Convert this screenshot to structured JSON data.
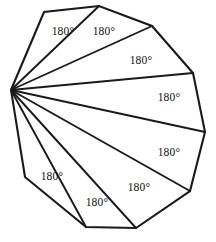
{
  "figure": {
    "name": "decagon-triangulation",
    "shape_label": "decagon",
    "stroke_color": "#1a1a1a",
    "fill_color": "#ffffff",
    "background_color": "#ffffff",
    "width": 216,
    "height": 242,
    "apex_vertex_index": 0,
    "vertices": [
      {
        "name": "apex",
        "x": 11,
        "y": 90
      },
      {
        "name": "v1",
        "x": 44,
        "y": 12
      },
      {
        "name": "v2",
        "x": 99,
        "y": 6
      },
      {
        "name": "v3",
        "x": 152,
        "y": 26
      },
      {
        "name": "v4",
        "x": 193,
        "y": 73
      },
      {
        "name": "v5",
        "x": 205,
        "y": 132
      },
      {
        "name": "v6",
        "x": 190,
        "y": 191
      },
      {
        "name": "v7",
        "x": 136,
        "y": 228
      },
      {
        "name": "v8",
        "x": 86,
        "y": 227
      },
      {
        "name": "v9",
        "x": 25,
        "y": 177
      }
    ],
    "diagonals": [
      {
        "name": "diagonal-1",
        "from": 0,
        "to": 2
      },
      {
        "name": "diagonal-2",
        "from": 0,
        "to": 3
      },
      {
        "name": "diagonal-3",
        "from": 0,
        "to": 4
      },
      {
        "name": "diagonal-4",
        "from": 0,
        "to": 5
      },
      {
        "name": "diagonal-5",
        "from": 0,
        "to": 6
      },
      {
        "name": "diagonal-6",
        "from": 0,
        "to": 7
      },
      {
        "name": "diagonal-7",
        "from": 0,
        "to": 8
      }
    ],
    "labels": [
      {
        "name": "triangle-label-1",
        "text": "180°",
        "x": 63,
        "y": 32
      },
      {
        "name": "triangle-label-2",
        "text": "180°",
        "x": 104,
        "y": 32
      },
      {
        "name": "triangle-label-3",
        "text": "180°",
        "x": 141,
        "y": 61
      },
      {
        "name": "triangle-label-4",
        "text": "180°",
        "x": 169,
        "y": 98
      },
      {
        "name": "triangle-label-5",
        "text": "180°",
        "x": 169,
        "y": 153
      },
      {
        "name": "triangle-label-6",
        "text": "180°",
        "x": 139,
        "y": 188
      },
      {
        "name": "triangle-label-7",
        "text": "180°",
        "x": 97,
        "y": 203
      },
      {
        "name": "triangle-label-8",
        "text": "180°",
        "x": 52,
        "y": 177
      }
    ]
  }
}
